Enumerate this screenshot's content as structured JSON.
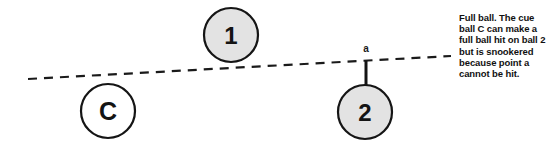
{
  "diagram": {
    "type": "snooker-shot-diagram",
    "canvas": {
      "width": 549,
      "height": 149,
      "background": "#ffffff"
    },
    "colors": {
      "ball_fill_object": "#e3e3e3",
      "ball_fill_cue": "#ffffff",
      "ball_stroke": "#151515",
      "line": "#1a1a1a",
      "text": "#111111"
    },
    "balls": [
      {
        "id": "ball-one",
        "label": "1",
        "cx": 231,
        "cy": 35,
        "r": 27,
        "fill": "#e3e3e3",
        "kind": "object-ball"
      },
      {
        "id": "ball-cue",
        "label": "C",
        "cx": 108,
        "cy": 111,
        "r": 27,
        "fill": "#ffffff",
        "kind": "cue-ball"
      },
      {
        "id": "ball-two",
        "label": "2",
        "cx": 365,
        "cy": 112,
        "r": 27,
        "fill": "#e3e3e3",
        "kind": "object-ball"
      }
    ],
    "aim_line": {
      "id": "aim-line",
      "style": "dashed",
      "x1": 28,
      "y1": 79,
      "x2": 451,
      "y2": 56,
      "dash": "9 7",
      "width": 2
    },
    "point_marker": {
      "id": "point-a",
      "label": "a",
      "label_x": 366,
      "label_y": 51,
      "tick_x": 366,
      "tick_y1": 62,
      "tick_y2": 86,
      "tick_width": 3
    },
    "caption": {
      "text": "Full ball. The cue ball C can make a full ball hit on ball 2 but is snookered because point a cannot be hit.",
      "lines": [
        "Full ball. The cue ball",
        "C can make a full",
        "ball hit on ball 2",
        "but is snookered",
        "because point a",
        "cannot be hit."
      ]
    }
  }
}
